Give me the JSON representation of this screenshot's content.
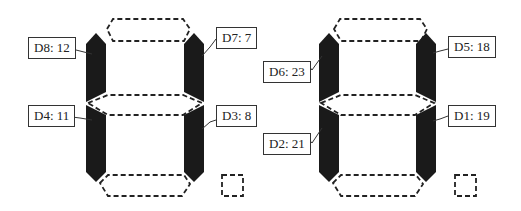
{
  "diagram": {
    "colors": {
      "lit": "#1a1a1a",
      "unlit_stroke": "#222222",
      "background": "#ffffff",
      "label_border": "#333333"
    },
    "digits": [
      {
        "id": "digit-left",
        "lit_segments": [
          "upper-left",
          "upper-right",
          "lower-left",
          "lower-right"
        ],
        "unlit_segments": [
          "top",
          "middle",
          "bottom",
          "decimal-point"
        ],
        "labels": [
          {
            "text": "D8: 12",
            "segment": "upper-left"
          },
          {
            "text": "D7: 7",
            "segment": "upper-right"
          },
          {
            "text": "D4: 11",
            "segment": "lower-left"
          },
          {
            "text": "D3: 8",
            "segment": "lower-right"
          }
        ]
      },
      {
        "id": "digit-right",
        "lit_segments": [
          "upper-left",
          "upper-right",
          "lower-left",
          "lower-right"
        ],
        "unlit_segments": [
          "top",
          "middle",
          "bottom",
          "decimal-point"
        ],
        "labels": [
          {
            "text": "D6: 23",
            "segment": "upper-left"
          },
          {
            "text": "D5: 18",
            "segment": "upper-right"
          },
          {
            "text": "D2: 21",
            "segment": "lower-left"
          },
          {
            "text": "D1: 19",
            "segment": "lower-right"
          }
        ]
      }
    ]
  }
}
